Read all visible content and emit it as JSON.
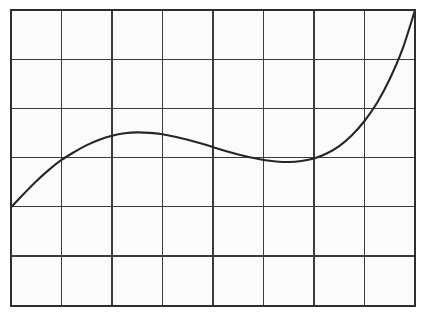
{
  "figure": {
    "name": "line-plot",
    "background_color": "#fbfbfb",
    "page_background_color": "#ffffff",
    "frame_color": "#2e2e2e",
    "grid_color": "#3b3b3b",
    "line_color": "#262626",
    "title": "",
    "subtitle": ""
  },
  "plot_area": {
    "left": 11,
    "top": 10,
    "right": 415,
    "bottom": 306,
    "width": 404,
    "height": 296
  },
  "chart_data": {
    "type": "line",
    "title": "",
    "subtitle": "",
    "xlabel": "",
    "ylabel": "",
    "xlim": [
      0,
      8
    ],
    "ylim": [
      0,
      6
    ],
    "grid": true,
    "grid_columns": 8,
    "grid_rows": 6,
    "x_ticks": [
      0,
      1,
      2,
      3,
      4,
      5,
      6,
      7,
      8
    ],
    "y_ticks": [
      0,
      1,
      2,
      3,
      4,
      5,
      6
    ],
    "x_tick_labels": [
      "",
      "",
      "",
      "",
      "",
      "",
      "",
      "",
      ""
    ],
    "y_tick_labels": [
      "",
      "",
      "",
      "",
      "",
      "",
      ""
    ],
    "legend": [],
    "legend_position": "none",
    "annotations": [],
    "series": [
      {
        "name": "curve",
        "color": "#262626",
        "x": [
          0.0,
          0.25,
          0.5,
          0.75,
          1.0,
          1.25,
          1.5,
          1.75,
          2.0,
          2.25,
          2.5,
          2.75,
          3.0,
          3.25,
          3.5,
          3.75,
          4.0,
          4.25,
          4.5,
          4.75,
          5.0,
          5.25,
          5.5,
          5.75,
          6.0,
          6.25,
          6.5,
          6.75,
          7.0,
          7.25,
          7.5,
          7.75,
          8.0
        ],
        "y": [
          2.0,
          2.27,
          2.53,
          2.76,
          2.96,
          3.12,
          3.26,
          3.37,
          3.45,
          3.5,
          3.52,
          3.51,
          3.48,
          3.43,
          3.37,
          3.3,
          3.22,
          3.14,
          3.07,
          3.01,
          2.96,
          2.93,
          2.92,
          2.94,
          2.99,
          3.09,
          3.24,
          3.46,
          3.75,
          4.12,
          4.6,
          5.2,
          6.0
        ],
        "key_points": {
          "start": [
            0,
            2.0
          ],
          "local_maximum": [
            2.52,
            3.52
          ],
          "local_minimum": [
            5.52,
            2.92
          ],
          "end": [
            8,
            6.0
          ]
        }
      }
    ]
  }
}
